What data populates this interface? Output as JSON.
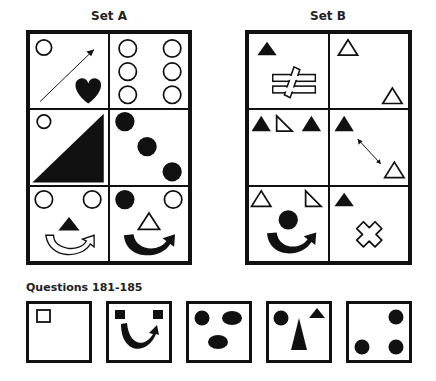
{
  "set_a": {
    "title": "Set A",
    "cells": [
      {
        "contents": [
          "hollow-circle",
          "diagonal-arrow",
          "black-heart"
        ]
      },
      {
        "contents": [
          "six-hollow-circles"
        ]
      },
      {
        "contents": [
          "hollow-circle",
          "black-right-triangle"
        ]
      },
      {
        "contents": [
          "three-black-circles-diagonal"
        ]
      },
      {
        "contents": [
          "two-hollow-circles",
          "black-triangle",
          "hollow-curved-arrow"
        ]
      },
      {
        "contents": [
          "black-circle",
          "hollow-circle",
          "hollow-triangle",
          "black-curved-arrow"
        ]
      }
    ]
  },
  "set_b": {
    "title": "Set B",
    "cells": [
      {
        "contents": [
          "black-triangle",
          "not-equal-sign"
        ]
      },
      {
        "contents": [
          "two-hollow-triangles"
        ]
      },
      {
        "contents": [
          "black-triangle",
          "hollow-right-triangle",
          "black-triangle"
        ]
      },
      {
        "contents": [
          "black-triangle",
          "double-arrow",
          "hollow-triangle"
        ]
      },
      {
        "contents": [
          "hollow-triangle",
          "hollow-right-triangle",
          "black-circle",
          "black-curved-arrow"
        ]
      },
      {
        "contents": [
          "black-triangle",
          "hollow-cross"
        ]
      }
    ]
  },
  "questions": {
    "title": "Questions 181-185",
    "items": [
      {
        "number": 181,
        "contents": [
          "hollow-square"
        ]
      },
      {
        "number": 182,
        "contents": [
          "two-black-squares",
          "black-curved-arrow"
        ]
      },
      {
        "number": 183,
        "contents": [
          "black-circle",
          "two-black-ovals"
        ]
      },
      {
        "number": 184,
        "contents": [
          "black-circle",
          "tall-black-triangle",
          "small-black-triangle"
        ]
      },
      {
        "number": 185,
        "contents": [
          "three-black-circles"
        ]
      }
    ]
  }
}
